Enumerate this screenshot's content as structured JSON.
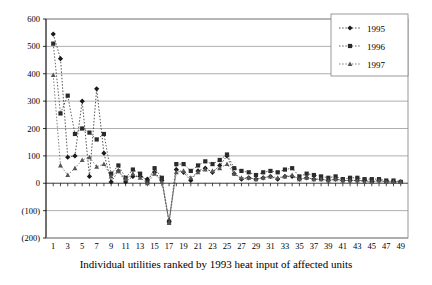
{
  "chart_data": {
    "type": "line",
    "title": "",
    "xlabel": "Individual utilities ranked by 1993 heat input of affected units",
    "ylabel": "",
    "xlim": [
      0,
      50
    ],
    "ylim": [
      -200,
      600
    ],
    "grid": true,
    "legend_position": "top-right",
    "ytick_labels": [
      "600",
      "500",
      "400",
      "300",
      "200",
      "100",
      "0",
      "(100)",
      "(200)"
    ],
    "ytick_values": [
      600,
      500,
      400,
      300,
      200,
      100,
      0,
      -100,
      -200
    ],
    "xtick_labels": [
      "1",
      "3",
      "5",
      "7",
      "9",
      "11",
      "13",
      "15",
      "17",
      "19",
      "21",
      "23",
      "25",
      "27",
      "29",
      "31",
      "33",
      "35",
      "37",
      "39",
      "41",
      "43",
      "45",
      "47",
      "49"
    ],
    "xtick_values": [
      1,
      3,
      5,
      7,
      9,
      11,
      13,
      15,
      17,
      19,
      21,
      23,
      25,
      27,
      29,
      31,
      33,
      35,
      37,
      39,
      41,
      43,
      45,
      47,
      49
    ],
    "x": [
      1,
      2,
      3,
      4,
      5,
      6,
      7,
      8,
      9,
      10,
      11,
      12,
      13,
      14,
      15,
      16,
      17,
      18,
      19,
      20,
      21,
      22,
      23,
      24,
      25,
      26,
      27,
      28,
      29,
      30,
      31,
      32,
      33,
      34,
      35,
      36,
      37,
      38,
      39,
      40,
      41,
      42,
      43,
      44,
      45,
      46,
      47,
      48,
      49
    ],
    "series": [
      {
        "name": "1995",
        "marker": "diamond",
        "color": "#1a1a1a",
        "values": [
          545,
          455,
          95,
          100,
          300,
          25,
          345,
          110,
          5,
          45,
          5,
          25,
          25,
          15,
          40,
          10,
          -140,
          50,
          40,
          10,
          45,
          55,
          40,
          65,
          100,
          35,
          15,
          20,
          15,
          20,
          25,
          15,
          25,
          25,
          15,
          20,
          15,
          15,
          10,
          15,
          10,
          10,
          10,
          10,
          5,
          10,
          5,
          5,
          5
        ]
      },
      {
        "name": "1996",
        "marker": "square",
        "color": "#2b2b2b",
        "values": [
          510,
          255,
          320,
          180,
          200,
          185,
          160,
          180,
          35,
          65,
          20,
          50,
          35,
          5,
          55,
          20,
          -140,
          70,
          70,
          45,
          65,
          80,
          70,
          85,
          105,
          55,
          45,
          40,
          30,
          40,
          45,
          40,
          50,
          55,
          25,
          35,
          30,
          25,
          20,
          25,
          15,
          20,
          20,
          15,
          15,
          15,
          10,
          10,
          5
        ]
      },
      {
        "name": "1997",
        "marker": "triangle",
        "color": "#555555",
        "values": [
          395,
          65,
          30,
          55,
          85,
          95,
          60,
          70,
          25,
          45,
          15,
          35,
          20,
          0,
          35,
          5,
          -145,
          40,
          45,
          20,
          40,
          50,
          45,
          55,
          70,
          35,
          20,
          20,
          15,
          20,
          25,
          20,
          25,
          30,
          15,
          20,
          15,
          15,
          10,
          15,
          10,
          10,
          10,
          5,
          5,
          10,
          5,
          5,
          5
        ]
      }
    ]
  },
  "legend": {
    "items": [
      {
        "label": "1995"
      },
      {
        "label": "1996"
      },
      {
        "label": "1997"
      }
    ]
  }
}
